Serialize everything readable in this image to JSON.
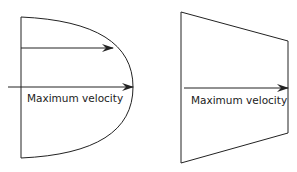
{
  "diagrams": [
    {
      "name": "parabolic-profile",
      "label": "Maximum velocity"
    },
    {
      "name": "trapezoidal-profile",
      "label": "Maximum velocity"
    }
  ],
  "colors": {
    "stroke": "#222222",
    "background": "#ffffff"
  }
}
